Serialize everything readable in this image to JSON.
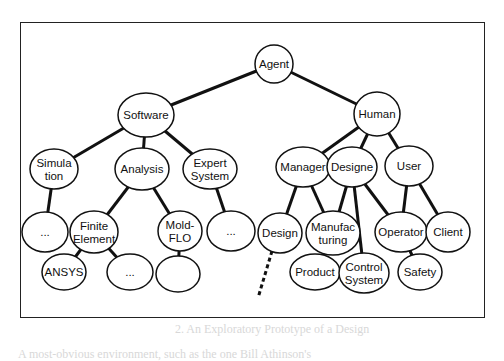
{
  "diagram": {
    "type": "tree",
    "title": "",
    "root": "agent",
    "nodes": [
      {
        "id": "agent",
        "lines": [
          "Agent"
        ],
        "cx": 274,
        "cy": 64,
        "rx": 19,
        "ry": 19
      },
      {
        "id": "software",
        "lines": [
          "Software"
        ],
        "cx": 146,
        "cy": 115,
        "rx": 28,
        "ry": 22
      },
      {
        "id": "human",
        "lines": [
          "Human"
        ],
        "cx": 377,
        "cy": 114,
        "rx": 23,
        "ry": 22
      },
      {
        "id": "simulation",
        "lines": [
          "Simula",
          "tion"
        ],
        "cx": 54,
        "cy": 169,
        "rx": 24,
        "ry": 20
      },
      {
        "id": "analysis",
        "lines": [
          "Analysis"
        ],
        "cx": 142,
        "cy": 169,
        "rx": 27,
        "ry": 21
      },
      {
        "id": "expert-system",
        "lines": [
          "Expert",
          "System"
        ],
        "cx": 210,
        "cy": 169,
        "rx": 27,
        "ry": 20
      },
      {
        "id": "manager",
        "lines": [
          "Manager"
        ],
        "cx": 303,
        "cy": 167,
        "rx": 27,
        "ry": 20
      },
      {
        "id": "designer",
        "lines": [
          "Designe"
        ],
        "cx": 352,
        "cy": 167,
        "rx": 25,
        "ry": 20
      },
      {
        "id": "user",
        "lines": [
          "User"
        ],
        "cx": 409,
        "cy": 166,
        "rx": 24,
        "ry": 20
      },
      {
        "id": "sim-more",
        "lines": [
          "..."
        ],
        "cx": 45,
        "cy": 232,
        "rx": 23,
        "ry": 20
      },
      {
        "id": "finite-element",
        "lines": [
          "Finite",
          "Element"
        ],
        "cx": 94,
        "cy": 232,
        "rx": 24,
        "ry": 21
      },
      {
        "id": "mold-flo",
        "lines": [
          "Mold-",
          "FLO"
        ],
        "cx": 180,
        "cy": 231,
        "rx": 22,
        "ry": 20
      },
      {
        "id": "expert-more",
        "lines": [
          "..."
        ],
        "cx": 231,
        "cy": 231,
        "rx": 24,
        "ry": 20
      },
      {
        "id": "design",
        "lines": [
          "Design"
        ],
        "cx": 280,
        "cy": 233,
        "rx": 22,
        "ry": 20
      },
      {
        "id": "manufacturing",
        "lines": [
          "Manufac",
          "turing"
        ],
        "cx": 333,
        "cy": 233,
        "rx": 27,
        "ry": 22
      },
      {
        "id": "operator",
        "lines": [
          "Operator"
        ],
        "cx": 401,
        "cy": 232,
        "rx": 26,
        "ry": 20
      },
      {
        "id": "client",
        "lines": [
          "Client"
        ],
        "cx": 448,
        "cy": 232,
        "rx": 22,
        "ry": 20
      },
      {
        "id": "ansys",
        "lines": [
          "ANSYS"
        ],
        "cx": 64,
        "cy": 272,
        "rx": 22,
        "ry": 18
      },
      {
        "id": "fe-more",
        "lines": [
          "..."
        ],
        "cx": 130,
        "cy": 272,
        "rx": 23,
        "ry": 18
      },
      {
        "id": "mold-child",
        "lines": [],
        "cx": 178,
        "cy": 274,
        "rx": 22,
        "ry": 18
      },
      {
        "id": "product",
        "lines": [
          "Product"
        ],
        "cx": 315,
        "cy": 272,
        "rx": 25,
        "ry": 18
      },
      {
        "id": "control-system",
        "lines": [
          "Control",
          "System"
        ],
        "cx": 364,
        "cy": 273,
        "rx": 25,
        "ry": 20
      },
      {
        "id": "safety",
        "lines": [
          "Safety"
        ],
        "cx": 420,
        "cy": 272,
        "rx": 22,
        "ry": 18
      }
    ],
    "edges": [
      {
        "from": "agent",
        "to": "software"
      },
      {
        "from": "agent",
        "to": "human"
      },
      {
        "from": "software",
        "to": "simulation"
      },
      {
        "from": "software",
        "to": "analysis"
      },
      {
        "from": "software",
        "to": "expert-system"
      },
      {
        "from": "human",
        "to": "manager"
      },
      {
        "from": "human",
        "to": "designer"
      },
      {
        "from": "human",
        "to": "user"
      },
      {
        "from": "simulation",
        "to": "sim-more"
      },
      {
        "from": "analysis",
        "to": "finite-element"
      },
      {
        "from": "analysis",
        "to": "mold-flo"
      },
      {
        "from": "expert-system",
        "to": "expert-more"
      },
      {
        "from": "finite-element",
        "to": "ansys"
      },
      {
        "from": "finite-element",
        "to": "fe-more"
      },
      {
        "from": "mold-flo",
        "to": "mold-child"
      },
      {
        "from": "manager",
        "to": "design"
      },
      {
        "from": "manager",
        "to": "manufacturing"
      },
      {
        "from": "designer",
        "to": "manufacturing"
      },
      {
        "from": "designer",
        "to": "control-system"
      },
      {
        "from": "designer",
        "to": "operator"
      },
      {
        "from": "user",
        "to": "operator"
      },
      {
        "from": "user",
        "to": "client"
      },
      {
        "from": "manufacturing",
        "to": "product"
      },
      {
        "from": "operator",
        "to": "safety"
      }
    ],
    "dashed_edges": [
      {
        "from": "design",
        "x2": 258,
        "y2": 298
      }
    ],
    "colors": {
      "stroke": "#111111",
      "fill": "#ffffff",
      "frame": "#222222"
    }
  },
  "page": {
    "bleed_text_bottom": "A most-obvious environment, such as the one Bill Athinson's",
    "bleed_text_middle": "2.  An Exploratory Prototype of a Design"
  }
}
